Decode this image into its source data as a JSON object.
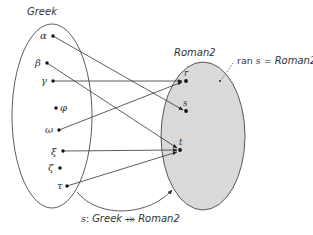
{
  "diagram": {
    "domain_set": {
      "title": "Greek",
      "elements": [
        {
          "symbol": "α",
          "x": 53,
          "y": 36
        },
        {
          "symbol": "β",
          "x": 47,
          "y": 63
        },
        {
          "symbol": "γ",
          "x": 53,
          "y": 81
        },
        {
          "symbol": "φ",
          "x": 56,
          "y": 108
        },
        {
          "symbol": "ω",
          "x": 59,
          "y": 130
        },
        {
          "symbol": "ξ",
          "x": 63,
          "y": 151
        },
        {
          "symbol": "ζ",
          "x": 60,
          "y": 168
        },
        {
          "symbol": "τ",
          "x": 67,
          "y": 186
        }
      ]
    },
    "codomain_set": {
      "title": "Roman2",
      "elements": [
        {
          "symbol": "r",
          "x": 185,
          "y": 81
        },
        {
          "symbol": "s",
          "x": 186,
          "y": 111
        },
        {
          "symbol": "t",
          "x": 180,
          "y": 150
        }
      ],
      "fill": "#d9d9d9"
    },
    "mappings": [
      {
        "from": "α",
        "to": "s"
      },
      {
        "from": "β",
        "to": "t"
      },
      {
        "from": "γ",
        "to": "r"
      },
      {
        "from": "ω",
        "to": "r"
      },
      {
        "from": "ξ",
        "to": "t"
      },
      {
        "from": "τ",
        "to": "t"
      }
    ],
    "annotation": {
      "prefix": "ran ",
      "fn": "s",
      "eq": " = ",
      "set": "Roman2"
    },
    "caption": {
      "fn": "s",
      "colon": ": ",
      "domain": "Greek",
      "arrow": " ⤀ ",
      "codomain": "Roman2"
    }
  }
}
